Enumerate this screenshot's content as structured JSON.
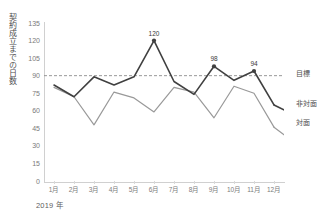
{
  "topstrip": {
    "text": " "
  },
  "chart_data": {
    "type": "line",
    "title": "",
    "ylabel": "契約成立までの日数",
    "xlabel": "2019 年",
    "categories": [
      "1月",
      "2月",
      "3月",
      "4月",
      "5月",
      "6月",
      "7月",
      "8月",
      "9月",
      "10月",
      "11月",
      "12月"
    ],
    "yticks": [
      135,
      120,
      105,
      90,
      75,
      60,
      45,
      30,
      15,
      0
    ],
    "ylim": [
      0,
      135
    ],
    "grid": false,
    "legend_position": "right-inline",
    "series": [
      {
        "name": "非対面",
        "color": "#404040",
        "width": 1.6,
        "values": [
          82,
          72,
          89,
          82,
          89,
          120,
          85,
          74,
          98,
          86,
          94,
          65
        ],
        "markers": [
          {
            "category": "6月",
            "value": 120
          },
          {
            "category": "9月",
            "value": 98
          },
          {
            "category": "11月",
            "value": 94
          }
        ],
        "point_labels": [
          {
            "category": "6月",
            "text": "120"
          },
          {
            "category": "9月",
            "text": "98"
          },
          {
            "category": "11月",
            "text": "94"
          }
        ]
      },
      {
        "name": "対面",
        "color": "#999999",
        "width": 1.2,
        "values": [
          80,
          72,
          48,
          76,
          71,
          59,
          80,
          76,
          54,
          81,
          75,
          46
        ],
        "markers": [],
        "point_labels": []
      }
    ],
    "reference_line": {
      "name": "目標",
      "value": 90,
      "style": "dashed",
      "color": "#8c8c8c"
    },
    "annotations": [
      "120",
      "98",
      "94"
    ]
  },
  "labels": {
    "target": "目標",
    "non_face_to_face": "非対面",
    "face_to_face": "対面",
    "year": "2019 年",
    "y_axis_title": "契約成立までの日数"
  },
  "colors": {
    "background": "#ffffff",
    "axis": "#d0d0d0",
    "tick_text": "#7a7a7a",
    "series_dark": "#404040",
    "series_light": "#999999",
    "target_line": "#8c8c8c"
  }
}
